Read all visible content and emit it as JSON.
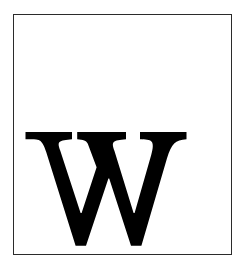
{
  "page": {
    "background_color": "#ffffff",
    "width": 247,
    "height": 279
  },
  "frame": {
    "name": "plate-border",
    "border_color": "#2b2b2b",
    "border_width_px": 1.5,
    "fill_color": "#ffffff",
    "left_px": 13,
    "top_px": 14,
    "width_px": 219,
    "height_px": 241
  },
  "glyph": {
    "character": "W",
    "label": "capital-letter-w",
    "style": "serif-bold",
    "color": "#000000",
    "position": "lower-left",
    "bounds": {
      "left_px": 24,
      "top_px": 132,
      "right_px": 186,
      "bottom_px": 247
    }
  }
}
